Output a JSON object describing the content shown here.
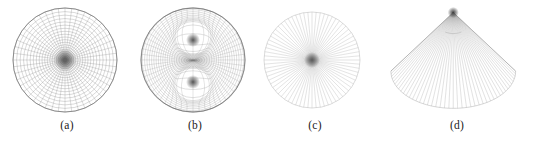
{
  "figure": {
    "background_color": "#ffffff",
    "width": 534,
    "height": 143,
    "panel_count": 4
  },
  "panels": [
    {
      "id": "a",
      "label": "(a)",
      "caption_text": "(a)",
      "shape": "circle",
      "description": "polar quadrilateral mesh on a disk with a single central singularity",
      "center_x": 65,
      "center_y": 60,
      "radius": 52,
      "rings": 22,
      "spokes": 48,
      "stroke_color": "#7a7a7a",
      "singularities": [
        {
          "x": 65,
          "y": 60,
          "radius": 11,
          "color": "#555555"
        }
      ]
    },
    {
      "id": "b",
      "label": "(b)",
      "caption_text": "(b)",
      "shape": "circle",
      "description": "quadrilateral mesh on a disk with two interior singular points forming a saddle pattern",
      "center_x": 65,
      "center_y": 60,
      "radius": 52,
      "rings": 24,
      "spokes": 56,
      "stroke_color": "#7d7d7d",
      "singularities": [
        {
          "x": 65,
          "y": 40,
          "radius": 7,
          "color": "#4d4d4d"
        },
        {
          "x": 65,
          "y": 82,
          "radius": 7,
          "color": "#4d4d4d"
        }
      ]
    },
    {
      "id": "c",
      "label": "(c)",
      "caption_text": "(c)",
      "shape": "circle",
      "description": "radial fan of straight segments from the disk center to the boundary",
      "center_x": 64,
      "center_y": 60,
      "radius": 48,
      "rings": 1,
      "spokes": 72,
      "stroke_color": "#b9b9b9",
      "singularities": [
        {
          "x": 64,
          "y": 60,
          "radius": 4,
          "color": "#555555"
        }
      ]
    },
    {
      "id": "d",
      "label": "(d)",
      "caption_text": "(d)",
      "shape": "cone",
      "description": "cone-shaped fan opened from a top apex down to a wide elliptical rim",
      "apex_x": 68,
      "apex_y": 9,
      "rim_center_x": 68,
      "rim_center_y": 72,
      "rim_rx": 67,
      "rim_ry": 40,
      "spokes": 44,
      "stroke_color": "#a8a8a8",
      "singularities": [
        {
          "x": 68,
          "y": 9,
          "radius": 3,
          "color": "#3a3a3a"
        }
      ]
    }
  ]
}
